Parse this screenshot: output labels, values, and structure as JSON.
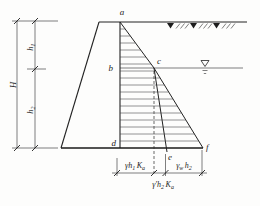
{
  "figure": {
    "points": {
      "a": "a",
      "b": "b",
      "c": "c",
      "d": "d",
      "e": "e",
      "f": "f"
    },
    "dims": {
      "H": "H",
      "h1": {
        "base": "h",
        "sub": "1"
      },
      "h2": {
        "base": "h",
        "sub": "2"
      }
    },
    "pressures": {
      "soil_above_water": {
        "p1": "γh",
        "s1": "1",
        "p2": "K",
        "s2": "a"
      },
      "water": {
        "p1": "γ",
        "s1": "w",
        "p2": "h",
        "s2": "2"
      },
      "soil_below_water": {
        "p1": "γ′h",
        "s1": "2",
        "p2": "K",
        "s2": "a"
      }
    },
    "colors": {
      "line": "#222222",
      "background": "#fdfdfc"
    }
  }
}
